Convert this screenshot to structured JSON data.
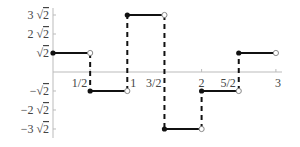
{
  "chart_data": {
    "type": "line",
    "subtype": "step-function",
    "title": "",
    "xlabel": "",
    "ylabel": "",
    "xlim": [
      0,
      3
    ],
    "ylim": [
      -4.2426,
      4.2426
    ],
    "grid": false,
    "legend": null,
    "x_ticks": [
      {
        "value": 0.5,
        "label": "1/2"
      },
      {
        "value": 1,
        "label": "1"
      },
      {
        "value": 1.5,
        "label": "3/2"
      },
      {
        "value": 2,
        "label": "2"
      },
      {
        "value": 2.5,
        "label": "5/2"
      },
      {
        "value": 3,
        "label": "3"
      }
    ],
    "y_ticks": [
      {
        "value": 4.2426,
        "label": "3 √2",
        "coef": "3"
      },
      {
        "value": 2.8284,
        "label": "2 √2",
        "coef": "2"
      },
      {
        "value": 1.4142,
        "label": "√2",
        "coef": ""
      },
      {
        "value": -1.4142,
        "label": "−√2",
        "coef": "−"
      },
      {
        "value": -2.8284,
        "label": "−2 √2",
        "coef": "−2"
      },
      {
        "value": -4.2426,
        "label": "−3 √2",
        "coef": "−3"
      }
    ],
    "segments": [
      {
        "x_start": 0,
        "x_end": 0.5,
        "y": 1.4142,
        "y_label": "√2",
        "start_closed": true,
        "end_closed": false
      },
      {
        "x_start": 0.5,
        "x_end": 1,
        "y": -1.4142,
        "y_label": "−√2",
        "start_closed": true,
        "end_closed": false
      },
      {
        "x_start": 1,
        "x_end": 1.5,
        "y": 4.2426,
        "y_label": "3 √2",
        "start_closed": true,
        "end_closed": false
      },
      {
        "x_start": 1.5,
        "x_end": 2,
        "y": -4.2426,
        "y_label": "−3 √2",
        "start_closed": true,
        "end_closed": false
      },
      {
        "x_start": 2,
        "x_end": 2.5,
        "y": -1.4142,
        "y_label": "−√2",
        "start_closed": true,
        "end_closed": false
      },
      {
        "x_start": 2.5,
        "x_end": 3,
        "y": 1.4142,
        "y_label": "√2",
        "start_closed": true,
        "end_closed": false
      }
    ],
    "jump_lines": "dashed vertical lines connect consecutive segments at each discontinuity",
    "colors": {
      "line": "#111111",
      "axis": "#bbbbbb",
      "label": "#444444"
    }
  }
}
